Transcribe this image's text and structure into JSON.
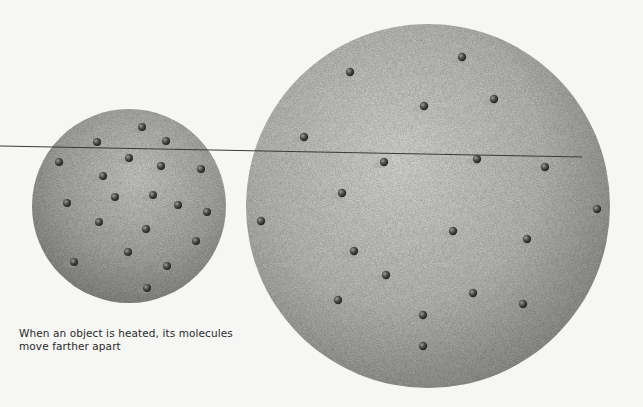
{
  "caption": {
    "line1": "When an object is heated, its molecules",
    "line2": "move farther apart"
  },
  "colors": {
    "background": "#f6f6f4",
    "sphere_light": "#d6d6d2",
    "sphere_dark": "#8e8e8a",
    "molecule": "#3e3e3c",
    "line": "#3a3a3a",
    "text": "#2a2a2a"
  },
  "small_sphere": {
    "label": "cool object",
    "cx": 129,
    "cy": 206,
    "r": 97,
    "molecules": [
      [
        142,
        127
      ],
      [
        97,
        142
      ],
      [
        166,
        141
      ],
      [
        59,
        162
      ],
      [
        129,
        158
      ],
      [
        161,
        166
      ],
      [
        201,
        169
      ],
      [
        103,
        176
      ],
      [
        115,
        197
      ],
      [
        153,
        195
      ],
      [
        67,
        203
      ],
      [
        178,
        205
      ],
      [
        207,
        212
      ],
      [
        99,
        222
      ],
      [
        146,
        229
      ],
      [
        196,
        241
      ],
      [
        128,
        252
      ],
      [
        74,
        262
      ],
      [
        167,
        266
      ],
      [
        147,
        288
      ]
    ]
  },
  "large_sphere": {
    "label": "heated object",
    "cx": 428,
    "cy": 206,
    "r": 182,
    "molecules": [
      [
        462,
        57
      ],
      [
        350,
        72
      ],
      [
        424,
        106
      ],
      [
        494,
        99
      ],
      [
        304,
        137
      ],
      [
        384,
        162
      ],
      [
        477,
        159
      ],
      [
        545,
        167
      ],
      [
        342,
        193
      ],
      [
        261,
        221
      ],
      [
        597,
        209
      ],
      [
        453,
        231
      ],
      [
        527,
        239
      ],
      [
        354,
        251
      ],
      [
        386,
        275
      ],
      [
        473,
        293
      ],
      [
        338,
        300
      ],
      [
        523,
        304
      ],
      [
        423,
        315
      ],
      [
        423,
        346
      ]
    ]
  },
  "reference_line": {
    "x1": 0,
    "y1": 146,
    "x2": 582,
    "y2": 157
  }
}
